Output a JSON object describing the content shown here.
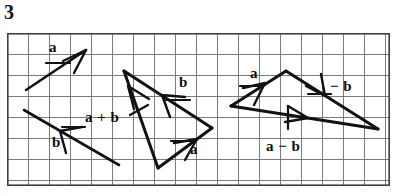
{
  "figure": {
    "problem_number": "3",
    "caption": "",
    "ink_color": "#111111",
    "grid_color": "#6b6b72",
    "grid_border_color": "#4a4a50",
    "paper_color": "#ffffff"
  },
  "grid": {
    "x": 7,
    "y": 33,
    "width": 383,
    "height": 153,
    "cell_size": 21,
    "columns": 18,
    "rows": 7
  },
  "diagrams": [
    {
      "name": "vectors-a-and-b",
      "labels": [
        {
          "id": "label-a-left",
          "text": "a",
          "x": 42,
          "y": 40
        },
        {
          "id": "label-b-left",
          "text": "b",
          "x": 45,
          "y": 135
        }
      ],
      "vectors": [
        {
          "id": "vector-a-left",
          "label": "a",
          "x1": 26,
          "y1": 90,
          "x2": 86,
          "y2": 50
        },
        {
          "id": "vector-b-left",
          "label": "b",
          "x1": 24,
          "y1": 110,
          "x2": 119,
          "y2": 165
        }
      ]
    },
    {
      "name": "triangle-a-plus-b",
      "labels": [
        {
          "id": "label-a-plus-b",
          "text": "a + b",
          "x": 85,
          "y": 110
        },
        {
          "id": "label-b-middle",
          "text": "b",
          "x": 179,
          "y": 75
        },
        {
          "id": "label-a-middle",
          "text": "a",
          "x": 190,
          "y": 142
        }
      ],
      "vectors": [
        {
          "id": "vector-a-plus-b",
          "label": "a + b",
          "x1": 124,
          "y1": 71,
          "x2": 158,
          "y2": 168
        },
        {
          "id": "vector-b-middle",
          "label": "b",
          "x1": 212,
          "y1": 128,
          "x2": 124,
          "y2": 71
        },
        {
          "id": "vector-a-middle",
          "label": "a",
          "x1": 158,
          "y1": 168,
          "x2": 212,
          "y2": 128
        }
      ]
    },
    {
      "name": "triangle-a-minus-b",
      "labels": [
        {
          "id": "label-a-right",
          "text": "a",
          "x": 250,
          "y": 66
        },
        {
          "id": "label-minus-b",
          "text": "− b",
          "x": 330,
          "y": 79
        },
        {
          "id": "label-a-minus-b",
          "text": "a − b",
          "x": 266,
          "y": 139
        }
      ],
      "vectors": [
        {
          "id": "vector-a-right",
          "label": "a",
          "x1": 231,
          "y1": 106,
          "x2": 286,
          "y2": 71
        },
        {
          "id": "vector-minus-b",
          "label": "− b",
          "x1": 286,
          "y1": 71,
          "x2": 378,
          "y2": 129
        },
        {
          "id": "vector-a-minus-b",
          "label": "a − b",
          "x1": 231,
          "y1": 106,
          "x2": 378,
          "y2": 129
        }
      ]
    }
  ]
}
